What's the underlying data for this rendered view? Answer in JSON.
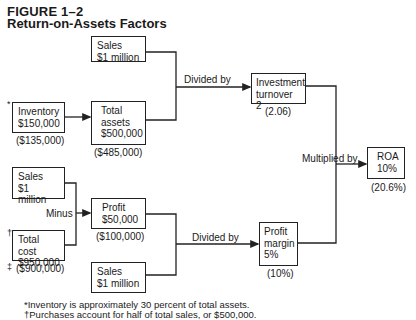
{
  "figure": {
    "number": "FIGURE 1–2",
    "title": "Return-on-Assets Factors"
  },
  "nodes": {
    "sales_top": {
      "text": "Sales\n$1 million"
    },
    "inventory": {
      "text": "Inventory\n$150,000",
      "alt_value": "($135,000)",
      "marker": "*"
    },
    "total_assets": {
      "text": "Total\nassets\n$500,000",
      "alt_value": "($485,000)"
    },
    "investment_turnover": {
      "text": "Investment\nturnover 2",
      "alt_value": "(2.06)"
    },
    "roa": {
      "text": "ROA\n10%",
      "alt_value": "(20.6%)"
    },
    "sales_left": {
      "text": "Sales\n$1 million"
    },
    "total_cost": {
      "text": "Total cost\n$950,000",
      "alt_value": "($900,000)",
      "marker_top": "†",
      "marker_bottom": "‡"
    },
    "profit": {
      "text": "Profit\n$50,000",
      "alt_value": "($100,000)"
    },
    "sales_bottom": {
      "text": "Sales\n$1 million"
    },
    "profit_margin": {
      "text": "Profit\nmargin\n5%",
      "alt_value": "(10%)"
    }
  },
  "operations": {
    "divided_by_top": "Divided by",
    "multiplied_by": "Multiplied by",
    "minus": "Minus",
    "divided_by_bottom": "Divided by"
  },
  "footnotes": [
    "*Inventory is approximately 30 percent of total assets.",
    "†Purchases account for half of total sales, or $500,000."
  ],
  "colors": {
    "ink": "#1a1a1a",
    "background": "#ffffff"
  }
}
